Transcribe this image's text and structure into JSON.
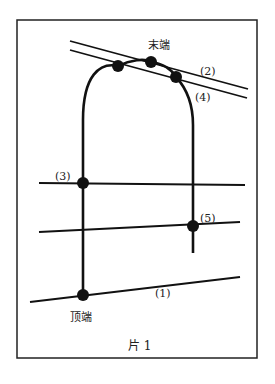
{
  "figure": {
    "caption": "片 1",
    "top_label": "末端",
    "bottom_label": "顶端",
    "line_labels": {
      "l1": "(1)",
      "l2": "(2)",
      "l3": "(3)",
      "l4": "(4)",
      "l5": "(5)"
    },
    "colors": {
      "stroke": "#111111",
      "frame": "#222222",
      "background": "#ffffff"
    }
  }
}
